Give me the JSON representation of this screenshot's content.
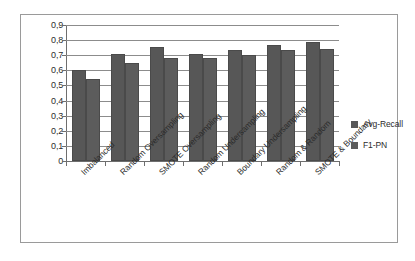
{
  "chart_data": {
    "type": "bar",
    "title": "",
    "subtitle": "",
    "xlabel": "",
    "ylabel": "",
    "ylim": [
      0,
      0.9
    ],
    "ytick_labels": [
      "0,9",
      "0,8",
      "0,7",
      "0,6",
      "0,5",
      "0,4",
      "0,3",
      "0,2",
      "0,1",
      "0"
    ],
    "ytick_values": [
      0.9,
      0.8,
      0.7,
      0.6,
      0.5,
      0.4,
      0.3,
      0.2,
      0.1,
      0
    ],
    "grid": true,
    "legend_position": "right",
    "decimal_separator": ",",
    "categories": [
      "Imbalanced",
      "Random Oversampling",
      "SMOTE Oversampling",
      "Random Undersampling",
      "Boundary Undersampling",
      "Random & Random",
      "SMOTE & Boundary"
    ],
    "series": [
      {
        "name": "Avg-Recall",
        "color": "#575757",
        "values": [
          0.6,
          0.71,
          0.755,
          0.71,
          0.735,
          0.765,
          0.79
        ]
      },
      {
        "name": "F1-PN",
        "color": "#5c5c5c",
        "values": [
          0.54,
          0.65,
          0.68,
          0.68,
          0.7,
          0.735,
          0.74
        ]
      }
    ]
  },
  "legend": {
    "items": [
      {
        "label": "Avg-Recall",
        "swatch": "legend-swatch-avg-recall"
      },
      {
        "label": "F1-PN",
        "swatch": "legend-swatch-f1-pn"
      }
    ]
  }
}
